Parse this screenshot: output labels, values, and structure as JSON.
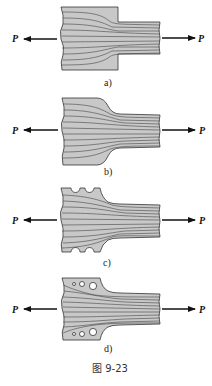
{
  "figure": {
    "caption": "图 9-23",
    "force_label": "P",
    "panels": [
      {
        "id": "a",
        "label": "a)",
        "description": "Abrupt step change in cross-section"
      },
      {
        "id": "b",
        "label": "b)",
        "description": "Gradual filleted transition"
      },
      {
        "id": "c",
        "label": "c)",
        "description": "Filleted transition with relief notches"
      },
      {
        "id": "d",
        "label": "d)",
        "description": "Filleted transition with relief holes"
      }
    ]
  },
  "colors": {
    "plate_fill": "#c8c8c8",
    "outline": "#333333",
    "arrow": "#111111"
  }
}
